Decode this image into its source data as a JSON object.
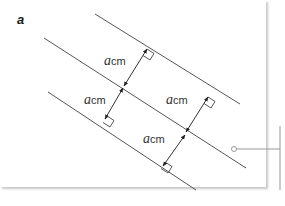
{
  "panel": {
    "label": "a"
  },
  "diagram": {
    "line_color": "#555555",
    "measurements": [
      {
        "id": "upper-left",
        "variable": "a",
        "unit": "cm"
      },
      {
        "id": "lower-left",
        "variable": "a",
        "unit": "cm"
      },
      {
        "id": "upper-right",
        "variable": "a",
        "unit": "cm"
      },
      {
        "id": "lower-right",
        "variable": "a",
        "unit": "cm"
      }
    ]
  },
  "callout": {
    "color": "#999999"
  }
}
